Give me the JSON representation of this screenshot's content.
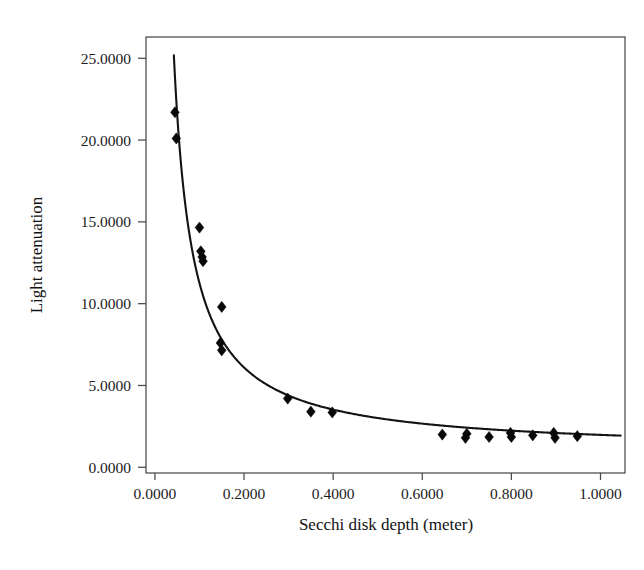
{
  "chart_data": {
    "type": "scatter",
    "title": "",
    "xlabel": "Secchi disk depth (meter)",
    "ylabel": "Light attenuation",
    "xlim": [
      -0.02,
      1.055
    ],
    "ylim": [
      -0.35,
      26.3
    ],
    "grid": false,
    "legend": null,
    "xticks": [
      0.0,
      0.2,
      0.4,
      0.6,
      0.8,
      1.0
    ],
    "xtick_labels": [
      "0.0000",
      "0.2000",
      "0.4000",
      "0.6000",
      "0.8000",
      "1.0000"
    ],
    "yticks": [
      0.0,
      5.0,
      10.0,
      15.0,
      20.0,
      25.0
    ],
    "ytick_labels": [
      "0.0000",
      "5.0000",
      "10.0000",
      "15.0000",
      "20.0000",
      "25.0000"
    ],
    "series": [
      {
        "name": "observations",
        "marker": "diamond",
        "color": "#080808",
        "points": [
          {
            "x": 0.045,
            "y": 21.7
          },
          {
            "x": 0.048,
            "y": 20.1
          },
          {
            "x": 0.1,
            "y": 14.65
          },
          {
            "x": 0.103,
            "y": 13.2
          },
          {
            "x": 0.106,
            "y": 12.85
          },
          {
            "x": 0.108,
            "y": 12.6
          },
          {
            "x": 0.15,
            "y": 9.8
          },
          {
            "x": 0.147,
            "y": 7.6
          },
          {
            "x": 0.15,
            "y": 7.15
          },
          {
            "x": 0.298,
            "y": 4.2
          },
          {
            "x": 0.35,
            "y": 3.4
          },
          {
            "x": 0.398,
            "y": 3.35
          },
          {
            "x": 0.645,
            "y": 2.0
          },
          {
            "x": 0.7,
            "y": 2.05
          },
          {
            "x": 0.697,
            "y": 1.8
          },
          {
            "x": 0.75,
            "y": 1.85
          },
          {
            "x": 0.798,
            "y": 2.1
          },
          {
            "x": 0.8,
            "y": 1.85
          },
          {
            "x": 0.848,
            "y": 1.95
          },
          {
            "x": 0.895,
            "y": 2.1
          },
          {
            "x": 0.898,
            "y": 1.8
          },
          {
            "x": 0.948,
            "y": 1.9
          }
        ]
      }
    ],
    "fit_curve": {
      "name": "fitted-curve",
      "form": "y = a / x + b",
      "a": 1.03,
      "b": 0.95,
      "color": "#131313",
      "x_start": 0.0425,
      "x_end": 1.045
    }
  }
}
